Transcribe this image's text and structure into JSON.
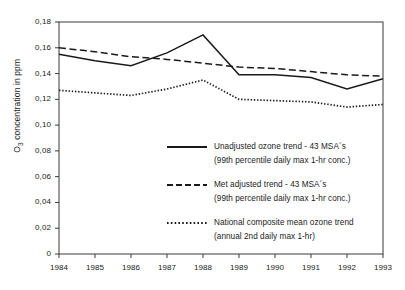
{
  "chart_data": {
    "type": "line",
    "title": "",
    "xlabel": "",
    "ylabel": "O3 concentration in ppm",
    "ylabel_prefix": "O",
    "ylabel_sub": "3",
    "ylabel_suffix": " concentration in ppm",
    "categories": [
      "1984",
      "1985",
      "1986",
      "1987",
      "1988",
      "1989",
      "1990",
      "1991",
      "1992",
      "1993"
    ],
    "x": [
      1984,
      1985,
      1986,
      1987,
      1988,
      1989,
      1990,
      1991,
      1992,
      1993
    ],
    "xlim": [
      1984,
      1993
    ],
    "ylim": [
      0,
      0.18
    ],
    "yticks": [
      0,
      0.02,
      0.04,
      0.06,
      0.08,
      0.1,
      0.12,
      0.14,
      0.16,
      0.18
    ],
    "ytick_labels": [
      "0",
      "0,02",
      "0,04",
      "0,06",
      "0,08",
      "0,10",
      "0,12",
      "0,14",
      "0,16",
      "0,18"
    ],
    "decimal_separator": ",",
    "grid": false,
    "legend_position": "inside-lower-center",
    "line_color": "#1a1a1a",
    "series": [
      {
        "name": "Unadjusted ozone trend - 43 MSA´s",
        "style": "solid",
        "values": [
          0.155,
          0.15,
          0.146,
          0.156,
          0.17,
          0.139,
          0.139,
          0.137,
          0.128,
          0.136
        ]
      },
      {
        "name": "Met adjusted trend - 43 MSA´s",
        "style": "dashed",
        "values": [
          0.16,
          0.157,
          0.153,
          0.151,
          0.148,
          0.145,
          0.144,
          0.1415,
          0.139,
          0.138
        ]
      },
      {
        "name": "National composite mean ozone trend",
        "style": "dotted",
        "values": [
          0.127,
          0.125,
          0.123,
          0.128,
          0.135,
          0.12,
          0.119,
          0.118,
          0.114,
          0.116
        ]
      }
    ]
  },
  "legend": {
    "items": [
      {
        "style": "solid",
        "line1": "Unadjusted ozone trend - 43 MSA´s",
        "line2": "(99th percentile daily max 1-hr conc.)"
      },
      {
        "style": "dashed",
        "line1": "Met adjusted trend - 43 MSA´s",
        "line2": "(99th percentile daily max 1-hr conc.)"
      },
      {
        "style": "dotted",
        "line1": "National composite mean ozone trend",
        "line2": "(annual 2nd daily max 1-hr)"
      }
    ]
  }
}
